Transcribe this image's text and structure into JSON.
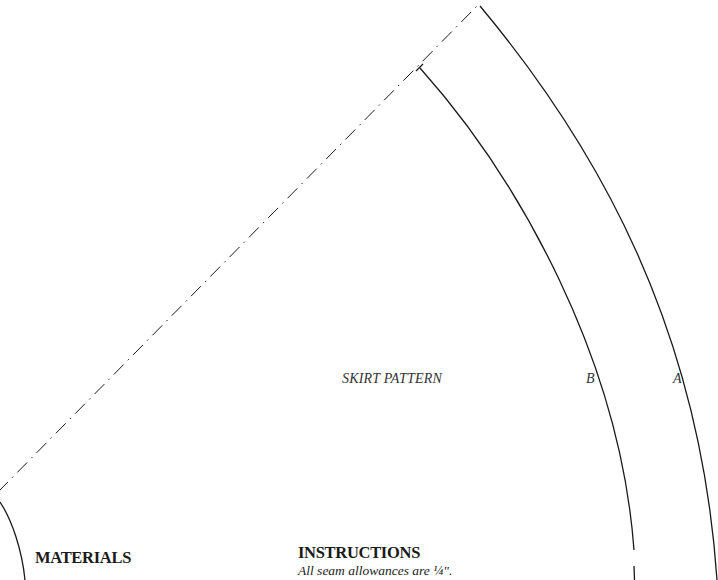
{
  "pattern": {
    "title": "SKIRT PATTERN",
    "arc_labels": {
      "inner": "B",
      "outer": "A"
    }
  },
  "sections": {
    "materials": {
      "heading": "MATERIALS"
    },
    "instructions": {
      "heading": "INSTRUCTIONS",
      "note": "All seam allowances are ¼\"."
    }
  },
  "colors": {
    "line": "#1a1a1a",
    "background": "#ffffff"
  }
}
